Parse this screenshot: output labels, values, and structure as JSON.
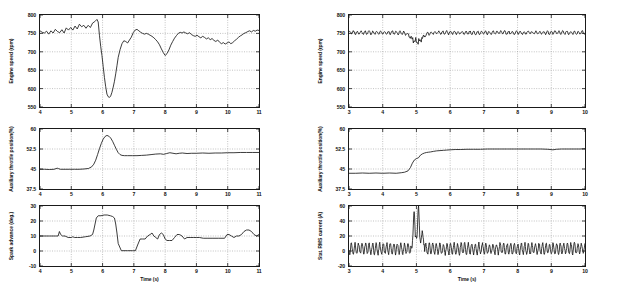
{
  "figure": {
    "width": 617,
    "height": 289,
    "background": "#ffffff",
    "line_color": "#1a1a1a",
    "grid_color": "#9a9a9a",
    "axis_color": "#1a1a1a"
  },
  "chart_data": [
    {
      "id": "left-engine-speed",
      "type": "line",
      "title": "",
      "xlabel": "",
      "ylabel": "Engine speed (rpm)",
      "xlim": [
        4,
        11
      ],
      "ylim": [
        550,
        800
      ],
      "xticks": [
        4,
        5,
        6,
        7,
        8,
        9,
        10,
        11
      ],
      "xticklabels": [
        "4",
        "5",
        "6",
        "7",
        "8",
        "9",
        "10",
        "11"
      ],
      "yticks": [
        550,
        600,
        650,
        700,
        750,
        800
      ],
      "yticklabels": [
        "550",
        "600",
        "650",
        "700",
        "750",
        "800"
      ],
      "grid": true,
      "legend": "none",
      "series": [
        {
          "name": "engine speed",
          "x": [
            4.0,
            4.07,
            4.14,
            4.21,
            4.28,
            4.35,
            4.42,
            4.49,
            4.56,
            4.63,
            4.7,
            4.77,
            4.84,
            4.91,
            4.98,
            5.05,
            5.12,
            5.19,
            5.26,
            5.33,
            5.4,
            5.47,
            5.54,
            5.61,
            5.68,
            5.75,
            5.82,
            5.86,
            5.9,
            5.94,
            5.98,
            6.02,
            6.06,
            6.1,
            6.14,
            6.18,
            6.22,
            6.26,
            6.3,
            6.34,
            6.38,
            6.42,
            6.46,
            6.5,
            6.56,
            6.62,
            6.68,
            6.74,
            6.8,
            6.86,
            6.92,
            6.98,
            7.04,
            7.1,
            7.16,
            7.22,
            7.28,
            7.34,
            7.4,
            7.46,
            7.52,
            7.58,
            7.64,
            7.7,
            7.76,
            7.82,
            7.88,
            7.94,
            8.0,
            8.06,
            8.12,
            8.18,
            8.24,
            8.3,
            8.36,
            8.42,
            8.48,
            8.54,
            8.6,
            8.66,
            8.72,
            8.78,
            8.84,
            8.9,
            8.96,
            9.02,
            9.08,
            9.14,
            9.2,
            9.26,
            9.32,
            9.38,
            9.44,
            9.5,
            9.56,
            9.62,
            9.68,
            9.74,
            9.8,
            9.86,
            9.92,
            9.98,
            10.04,
            10.1,
            10.16,
            10.22,
            10.28,
            10.34,
            10.4,
            10.46,
            10.52,
            10.58,
            10.64,
            10.7,
            10.76,
            10.82,
            10.88,
            10.94,
            11.0
          ],
          "y": [
            757,
            753,
            751,
            756,
            748,
            757,
            751,
            761,
            755,
            752,
            760,
            751,
            765,
            759,
            766,
            759,
            770,
            762,
            775,
            768,
            772,
            764,
            772,
            766,
            778,
            782,
            788,
            781,
            745,
            715,
            690,
            660,
            630,
            605,
            585,
            578,
            576,
            580,
            590,
            604,
            620,
            640,
            662,
            685,
            706,
            722,
            730,
            728,
            724,
            732,
            740,
            752,
            759,
            761,
            757,
            753,
            750,
            748,
            750,
            748,
            745,
            742,
            738,
            733,
            727,
            719,
            708,
            698,
            690,
            695,
            705,
            718,
            728,
            737,
            744,
            750,
            753,
            751,
            754,
            751,
            749,
            752,
            747,
            744,
            742,
            745,
            741,
            738,
            742,
            739,
            735,
            738,
            733,
            736,
            731,
            728,
            732,
            726,
            722,
            725,
            721,
            724,
            727,
            722,
            725,
            730,
            734,
            739,
            743,
            746,
            750,
            752,
            755,
            757,
            754,
            758,
            756,
            759,
            758
          ]
        }
      ]
    },
    {
      "id": "left-aux-throttle",
      "type": "line",
      "title": "",
      "xlabel": "",
      "ylabel": "Auxiliary throttle position(%)",
      "xlim": [
        4,
        11
      ],
      "ylim": [
        37.5,
        60
      ],
      "xticks": [
        4,
        5,
        6,
        7,
        8,
        9,
        10,
        11
      ],
      "xticklabels": [
        "4",
        "5",
        "6",
        "7",
        "8",
        "9",
        "10",
        "11"
      ],
      "yticks": [
        37.5,
        45,
        52.5,
        60
      ],
      "yticklabels": [
        "37.5",
        "45",
        "52.5",
        "60"
      ],
      "grid": true,
      "legend": "none",
      "series": [
        {
          "name": "aux throttle position",
          "x": [
            4.0,
            4.15,
            4.3,
            4.45,
            4.55,
            4.6,
            4.65,
            4.8,
            4.95,
            5.1,
            5.25,
            5.4,
            5.55,
            5.65,
            5.72,
            5.78,
            5.84,
            5.9,
            5.96,
            6.02,
            6.08,
            6.14,
            6.2,
            6.26,
            6.32,
            6.38,
            6.44,
            6.5,
            6.56,
            6.62,
            6.7,
            6.8,
            6.95,
            7.1,
            7.25,
            7.4,
            7.55,
            7.7,
            7.85,
            7.95,
            8.05,
            8.15,
            8.25,
            8.35,
            8.45,
            8.55,
            8.7,
            8.85,
            9.0,
            9.2,
            9.4,
            9.6,
            9.8,
            10.0,
            10.2,
            10.4,
            10.6,
            10.8,
            11.0
          ],
          "y": [
            44.9,
            44.9,
            44.8,
            44.9,
            45.3,
            45.1,
            44.9,
            44.9,
            44.9,
            44.9,
            44.9,
            45.0,
            45.2,
            45.8,
            46.8,
            48.3,
            50.4,
            52.6,
            54.6,
            56.2,
            57.2,
            57.6,
            57.3,
            56.6,
            55.4,
            53.9,
            52.4,
            51.1,
            50.4,
            50.1,
            50.0,
            50.0,
            50.0,
            50.0,
            50.1,
            50.2,
            50.4,
            50.6,
            50.7,
            50.5,
            50.8,
            51.1,
            50.9,
            50.7,
            50.9,
            51.0,
            50.8,
            50.9,
            50.9,
            51.0,
            50.9,
            51.0,
            51.0,
            51.1,
            51.1,
            51.2,
            51.2,
            51.2,
            51.2
          ]
        }
      ]
    },
    {
      "id": "left-spark-advance",
      "type": "line",
      "title": "",
      "xlabel": "Time (s)",
      "ylabel": "Spark advance (deg.)",
      "xlim": [
        4,
        11
      ],
      "ylim": [
        -10,
        30
      ],
      "xticks": [
        4,
        5,
        6,
        7,
        8,
        9,
        10,
        11
      ],
      "xticklabels": [
        "4",
        "5",
        "6",
        "7",
        "8",
        "9",
        "10",
        "11"
      ],
      "yticks": [
        -10,
        0,
        10,
        20,
        30
      ],
      "yticklabels": [
        "-10",
        "0",
        "10",
        "20",
        "30"
      ],
      "grid": true,
      "legend": "none",
      "series": [
        {
          "name": "spark advance",
          "x": [
            4.0,
            4.3,
            4.5,
            4.58,
            4.62,
            4.66,
            4.72,
            4.8,
            4.9,
            5.0,
            5.05,
            5.1,
            5.2,
            5.3,
            5.45,
            5.6,
            5.68,
            5.72,
            5.76,
            5.8,
            5.86,
            5.95,
            6.05,
            6.15,
            6.25,
            6.32,
            6.38,
            6.42,
            6.46,
            6.5,
            6.6,
            6.8,
            6.95,
            7.0,
            7.05,
            7.12,
            7.2,
            7.28,
            7.36,
            7.44,
            7.52,
            7.58,
            7.64,
            7.7,
            7.76,
            7.82,
            7.88,
            7.94,
            8.0,
            8.06,
            8.14,
            8.22,
            8.3,
            8.38,
            8.46,
            8.54,
            8.62,
            8.7,
            8.8,
            8.9,
            9.0,
            9.1,
            9.22,
            9.34,
            9.5,
            9.7,
            9.9,
            9.98,
            10.04,
            10.12,
            10.2,
            10.28,
            10.36,
            10.44,
            10.52,
            10.6,
            10.68,
            10.76,
            10.84,
            10.92,
            11.0
          ],
          "y": [
            10,
            10,
            10,
            10,
            13,
            11,
            10,
            10,
            9,
            9,
            9.5,
            9,
            9,
            9,
            9.5,
            10,
            11,
            14,
            18,
            22,
            23.5,
            23.5,
            24,
            24,
            23.5,
            23,
            22,
            18,
            12,
            5,
            0.2,
            0.2,
            0.2,
            0.2,
            0.2,
            4,
            8,
            8,
            8,
            10,
            11,
            12,
            10,
            9,
            8,
            11,
            12,
            11,
            8,
            7,
            7,
            7,
            9,
            11,
            11,
            10,
            8,
            9,
            9,
            9,
            9,
            9,
            8.5,
            8.5,
            8.5,
            8.5,
            8.5,
            11,
            11,
            10,
            9,
            10,
            10,
            11,
            13,
            14,
            14,
            13,
            11,
            10,
            11
          ]
        }
      ]
    },
    {
      "id": "right-engine-speed",
      "type": "line",
      "title": "",
      "xlabel": "",
      "ylabel": "Engine speed (rpm)",
      "xlim": [
        3,
        10
      ],
      "ylim": [
        550,
        800
      ],
      "xticks": [
        3,
        4,
        5,
        6,
        7,
        8,
        9,
        10
      ],
      "xticklabels": [
        "3",
        "4",
        "5",
        "6",
        "7",
        "8",
        "9",
        "10"
      ],
      "yticks": [
        550,
        600,
        650,
        700,
        750,
        800
      ],
      "yticklabels": [
        "550",
        "600",
        "650",
        "700",
        "750",
        "800"
      ],
      "grid": true,
      "legend": "none",
      "series": [
        {
          "name": "engine speed regulated",
          "baseline": 752,
          "ripple_amplitude": 7,
          "ripple_period": 0.115,
          "dip": {
            "center": 5.02,
            "depth": 30,
            "width": 0.22
          },
          "note": "near-constant 750 rpm with small sawtooth ripple and one dip to ~722 rpm near t=5"
        }
      ]
    },
    {
      "id": "right-aux-throttle",
      "type": "line",
      "title": "",
      "xlabel": "",
      "ylabel": "Auxiliary throttle position(%)",
      "xlim": [
        3,
        10
      ],
      "ylim": [
        37.5,
        60
      ],
      "xticks": [
        3,
        4,
        5,
        6,
        7,
        8,
        9,
        10
      ],
      "xticklabels": [
        "3",
        "4",
        "5",
        "6",
        "7",
        "8",
        "9",
        "10"
      ],
      "yticks": [
        37.5,
        45,
        52.5,
        60
      ],
      "yticklabels": [
        "37.5",
        "45",
        "52.5",
        "60"
      ],
      "grid": true,
      "legend": "none",
      "series": [
        {
          "name": "aux throttle position step",
          "x": [
            3.0,
            3.2,
            3.4,
            3.6,
            3.8,
            4.0,
            4.2,
            4.4,
            4.55,
            4.65,
            4.75,
            4.82,
            4.88,
            4.94,
            5.0,
            5.06,
            5.12,
            5.18,
            5.24,
            5.3,
            5.36,
            5.42,
            5.5,
            5.6,
            5.7,
            5.8,
            5.9,
            6.0,
            6.15,
            6.3,
            6.5,
            6.7,
            6.9,
            7.1,
            7.3,
            7.5,
            7.7,
            7.9,
            8.1,
            8.3,
            8.5,
            8.7,
            8.9,
            9.05,
            9.15,
            9.3,
            9.5,
            9.7,
            9.85,
            10.0
          ],
          "y": [
            43.4,
            43.4,
            43.5,
            43.4,
            43.5,
            43.4,
            43.5,
            43.4,
            43.6,
            43.8,
            44.3,
            45.5,
            47.2,
            48.4,
            48.9,
            49.2,
            50.2,
            50.7,
            51.0,
            51.2,
            51.3,
            51.4,
            51.6,
            51.8,
            51.9,
            52.0,
            52.1,
            52.2,
            52.3,
            52.3,
            52.4,
            52.4,
            52.4,
            52.5,
            52.5,
            52.5,
            52.5,
            52.5,
            52.5,
            52.5,
            52.5,
            52.5,
            52.4,
            52.2,
            52.4,
            52.5,
            52.5,
            52.5,
            52.5,
            52.6
          ]
        }
      ]
    },
    {
      "id": "right-stator-current",
      "type": "line",
      "title": "",
      "xlabel": "Time (s)",
      "ylabel": "Stat. RMS current (A)",
      "xlim": [
        3,
        10
      ],
      "ylim": [
        -20,
        60
      ],
      "xticks": [
        3,
        4,
        5,
        6,
        7,
        8,
        9,
        10
      ],
      "xticklabels": [
        "3",
        "4",
        "5",
        "6",
        "7",
        "8",
        "9",
        "10"
      ],
      "yticks": [
        -20,
        0,
        20,
        40,
        60
      ],
      "yticklabels": [
        "-20",
        "0",
        "20",
        "40",
        "60"
      ],
      "grid": true,
      "legend": "none",
      "series": [
        {
          "name": "stator rms current",
          "baseline": 3,
          "oscillation_amplitude": 7,
          "oscillation_period": 0.105,
          "spikes": [
            {
              "t": 4.93,
              "peak": 53
            },
            {
              "t": 5.0,
              "trough": 18
            },
            {
              "t": 5.06,
              "peak": 59
            },
            {
              "t": 5.16,
              "value": 25
            }
          ],
          "note": "oscillates about +3 A between -8 and +12 A, with a twin spike to 53 and 59 A near t=5"
        }
      ]
    }
  ]
}
